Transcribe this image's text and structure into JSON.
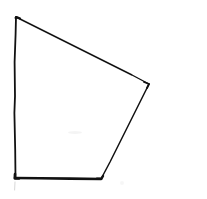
{
  "canvas": {
    "width": 207,
    "height": 199,
    "background_color": "#ffffff",
    "title": "Hand-drawn quadrilateral"
  },
  "figure": {
    "name": "quadrilateral",
    "shape_type": "convex quadrilateral",
    "sides": 4,
    "ink_color": "#111111",
    "fill": "none",
    "vertices": [
      {
        "label": "top-left",
        "x": 16,
        "y": 17
      },
      {
        "label": "right",
        "x": 149,
        "y": 84
      },
      {
        "label": "bottom-right",
        "x": 101,
        "y": 179
      },
      {
        "label": "bottom-left",
        "x": 15,
        "y": 178
      }
    ],
    "edges": [
      {
        "name": "top-edge",
        "from": "top-left",
        "to": "right",
        "stroke_width": 1.4
      },
      {
        "name": "right-edge",
        "from": "right",
        "to": "bottom-right",
        "stroke_width": 1.5
      },
      {
        "name": "bottom-edge",
        "from": "bottom-right",
        "to": "bottom-left",
        "stroke_width": 2.6
      },
      {
        "name": "left-edge",
        "from": "bottom-left",
        "to": "top-left",
        "stroke_width": 1.8
      }
    ],
    "left_edge_path": "M 15.5 178 L 15.2 150 L 14.4 113 L 15.0 96 L 14.6 62 L 15.6 34 L 16 17",
    "top_edge_path": "M 16 17 L 60 39 L 104 61 L 132 75 L 149 84",
    "right_edge_path": "M 149 84 L 145 92 L 127 128 L 110 162 L 101 179",
    "bottom_edge_path": "M 101 179 L 70 178.6 L 40 178.2 L 15 178"
  },
  "artifacts": {
    "paper_smudge": {
      "x": 68,
      "y": 131,
      "width": 14,
      "height": 3,
      "color": "#f2f2f2"
    },
    "pen_tail_below_corner": {
      "path": "M 15 182 L 14.6 190",
      "color": "#d8d8d8"
    },
    "faint_dot_right_of_bottom": {
      "x": 122,
      "y": 183,
      "radius": 2,
      "color": "#f4f4f4"
    }
  }
}
